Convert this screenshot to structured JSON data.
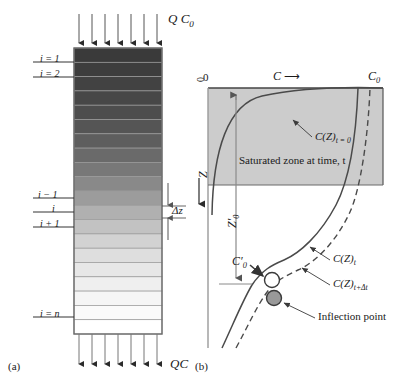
{
  "figure": {
    "panel_a": {
      "label": "(a)",
      "top_flux_label": "Q C",
      "top_flux_sub": "0",
      "bottom_flux_label": "QC",
      "cell_labels": [
        "i = 1",
        "i = 2",
        "i − 1",
        "i",
        "i + 1",
        "i = n"
      ],
      "delta_label": "Δz",
      "n_arrows_top": 7,
      "n_arrows_bottom": 7,
      "n_cells": 20,
      "column_shades": [
        "#3a3a3a",
        "#3d3d3d",
        "#424242",
        "#474747",
        "#4d4d4d",
        "#555555",
        "#5e5e5e",
        "#6a6a6a",
        "#787878",
        "#898989",
        "#9c9c9c",
        "#b0b0b0",
        "#c2c2c2",
        "#d2d2d2",
        "#dedede",
        "#e7e7e7",
        "#efefef",
        "#f5f5f5",
        "#fafafa",
        "#ffffff"
      ]
    },
    "panel_b": {
      "label": "(b)",
      "axis_x_origin": "0",
      "axis_x_arrow_label": "C",
      "axis_x_arrow": "⟶",
      "axis_x_max": "C",
      "axis_x_max_sub": "0",
      "axis_y_origin": "0",
      "axis_y_label": "Z",
      "z0_label": "Z",
      "z0_sub": "0",
      "z0_prime": "′",
      "c0_label": "C",
      "c0_sub": "0",
      "c0_prime": "′",
      "saturated_zone_label": "Saturated zone at time, t",
      "curve_t0_label": "C(Z)",
      "curve_t0_sub": "t = 0",
      "curve_t_label": "C(Z)",
      "curve_t_sub": "t",
      "curve_tdt_label": "C(Z)",
      "curve_tdt_sub": "t+Δt",
      "inflection_label": "Inflection point",
      "zone_fill": "#cccccc",
      "marker_open_fill": "#ffffff",
      "marker_filled_fill": "#999999"
    }
  }
}
